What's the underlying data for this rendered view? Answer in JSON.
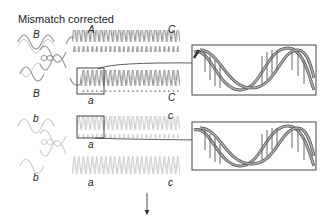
{
  "title": "Mismatch corrected",
  "labels": {
    "top_B_upper": "B",
    "top_A": "A",
    "top_C_upper": "C",
    "top_B_lower": "B",
    "top_a": "a",
    "top_C_lower": "C",
    "bottom_b_upper": "b",
    "bottom_a_upper": "a",
    "bottom_c_upper": "c",
    "bottom_b_lower": "b",
    "bottom_a_lower": "a",
    "bottom_c_lower": "c"
  },
  "colors": {
    "strand_dark": "#8a8a8a",
    "strand_light": "#c8c8c8",
    "box": "#444444",
    "text": "#222222"
  }
}
